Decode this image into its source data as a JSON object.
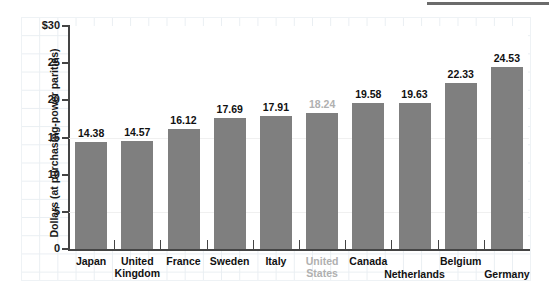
{
  "chart_data": {
    "type": "bar",
    "title": "",
    "subtitle": "",
    "xlabel": "",
    "ylabel": "Dollars (at purchasing-power parities)",
    "ylim": [
      0,
      30
    ],
    "yticks": [
      "0",
      "5",
      "10",
      "15",
      "20",
      "25",
      "$30"
    ],
    "grid": true,
    "legend": "none",
    "orientation": "vertical",
    "bar_color": "#7f7f7f",
    "highlight_color": "#b0b0b0",
    "categories": [
      "Japan",
      "United Kingdom",
      "France",
      "Sweden",
      "Italy",
      "United States",
      "Canada",
      "Netherlands",
      "Belgium",
      "Germany"
    ],
    "values": [
      14.38,
      14.57,
      16.12,
      17.69,
      17.91,
      18.24,
      19.58,
      19.63,
      22.33,
      24.53
    ],
    "value_labels": [
      "14.38",
      "14.57",
      "16.12",
      "17.69",
      "17.91",
      "18.24",
      "19.58",
      "19.63",
      "22.33",
      "24.53"
    ],
    "muted_index": 5,
    "label_lines": [
      [
        "Japan"
      ],
      [
        "United",
        "Kingdom"
      ],
      [
        "France"
      ],
      [
        "Sweden"
      ],
      [
        "Italy"
      ],
      [
        "United",
        "States"
      ],
      [
        "Canada"
      ],
      [
        "Netherlands"
      ],
      [
        "Belgium"
      ],
      [
        "Germany"
      ]
    ],
    "label_row": [
      0,
      0,
      0,
      0,
      0,
      0,
      0,
      1,
      0,
      1
    ]
  }
}
